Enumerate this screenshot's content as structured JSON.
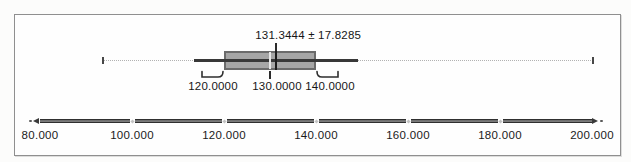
{
  "chart_data": {
    "type": "boxplot",
    "orientation": "horizontal",
    "mean": 131.3444,
    "std_dev": 17.8285,
    "mean_label": "131.3444 ± 17.8285",
    "box": {
      "lower": 120.0,
      "center": 130.0,
      "upper": 140.0,
      "lower_label": "120.0000",
      "center_label": "130.0000",
      "upper_label": "140.0000"
    },
    "solid_line_range": [
      113.5159,
      149.1729
    ],
    "dotted_line_range_est": [
      93.8,
      200.3
    ],
    "axis": {
      "min": 80,
      "max": 200,
      "ticks": [
        80,
        100,
        120,
        140,
        160,
        180,
        200
      ],
      "tick_labels": [
        "80.000",
        "100.000",
        "120.000",
        "140.000",
        "160.000",
        "180.000",
        "200.000"
      ]
    },
    "colors": {
      "box_fill": "#a6a6a6",
      "box_border": "#6b6b6b",
      "line": "#383838",
      "dotted_line": "#b2b2b2",
      "text": "#1d1d1d"
    }
  }
}
